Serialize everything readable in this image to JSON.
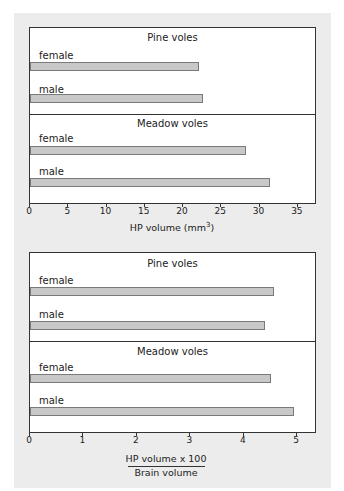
{
  "chart_data": [
    {
      "type": "bar",
      "orientation": "horizontal",
      "title": "",
      "groups": [
        "Pine voles",
        "Meadow voles"
      ],
      "categories": [
        "female",
        "male"
      ],
      "series": [
        {
          "group": "Pine voles",
          "name": "female",
          "value": 22.1
        },
        {
          "group": "Pine voles",
          "name": "male",
          "value": 22.6
        },
        {
          "group": "Meadow voles",
          "name": "female",
          "value": 28.2
        },
        {
          "group": "Meadow voles",
          "name": "male",
          "value": 31.4
        }
      ],
      "xlabel": "HP volume (mm³)",
      "xlabel_base": "HP volume (mm",
      "xlabel_sup": "3",
      "xlabel_end": ")",
      "xticks": [
        "0",
        "5",
        "10",
        "15",
        "20",
        "25",
        "30",
        "35"
      ],
      "xlim": [
        0,
        37.5
      ],
      "grid": false,
      "legend": "none"
    },
    {
      "type": "bar",
      "orientation": "horizontal",
      "title": "",
      "groups": [
        "Pine voles",
        "Meadow voles"
      ],
      "categories": [
        "female",
        "male"
      ],
      "series": [
        {
          "group": "Pine voles",
          "name": "female",
          "value": 4.57
        },
        {
          "group": "Pine voles",
          "name": "male",
          "value": 4.4
        },
        {
          "group": "Meadow voles",
          "name": "female",
          "value": 4.5
        },
        {
          "group": "Meadow voles",
          "name": "male",
          "value": 4.94
        }
      ],
      "xlabel_numerator": "HP volume x 100",
      "xlabel_denominator": "Brain volume",
      "xticks": [
        "0",
        "1",
        "2",
        "3",
        "4",
        "5"
      ],
      "xlim": [
        0,
        5.37
      ],
      "grid": false,
      "legend": "none"
    }
  ]
}
